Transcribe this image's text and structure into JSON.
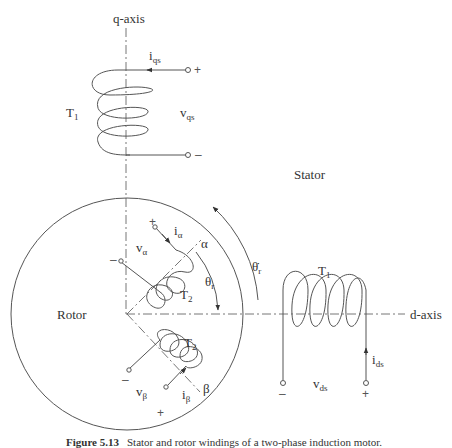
{
  "diagram": {
    "axes": {
      "q_axis": "q-axis",
      "d_axis": "d-axis"
    },
    "regions": {
      "stator": "Stator",
      "rotor": "Rotor"
    },
    "stator_q_winding": {
      "turns_label": "T",
      "turns_sub": "1",
      "current": "i",
      "current_sub": "qs",
      "voltage": "v",
      "voltage_sub": "qs",
      "plus": "+",
      "minus": "–"
    },
    "stator_d_winding": {
      "turns_label": "T",
      "turns_sub": "1",
      "current": "i",
      "current_sub": "ds",
      "voltage": "v",
      "voltage_sub": "ds",
      "plus": "+",
      "minus": "–"
    },
    "rotor_alpha_winding": {
      "turns_label": "T",
      "turns_sub": "2",
      "current": "i",
      "current_sub": "α",
      "voltage": "v",
      "voltage_sub": "α",
      "axis_label": "α",
      "plus": "+",
      "minus": "–"
    },
    "rotor_beta_winding": {
      "turns_label": "T",
      "turns_sub": "2",
      "current": "i",
      "current_sub": "β",
      "voltage": "v",
      "voltage_sub": "β",
      "axis_label": "β",
      "plus": "+",
      "minus": "–"
    },
    "angles": {
      "theta_r": "θ",
      "theta_r_sub": "r",
      "theta_r_dot": "θ̇",
      "theta_r_dot_sub": "r"
    }
  },
  "caption": {
    "figure_number": "Figure 5.13",
    "text": "Stator and rotor windings of a two-phase induction motor."
  }
}
